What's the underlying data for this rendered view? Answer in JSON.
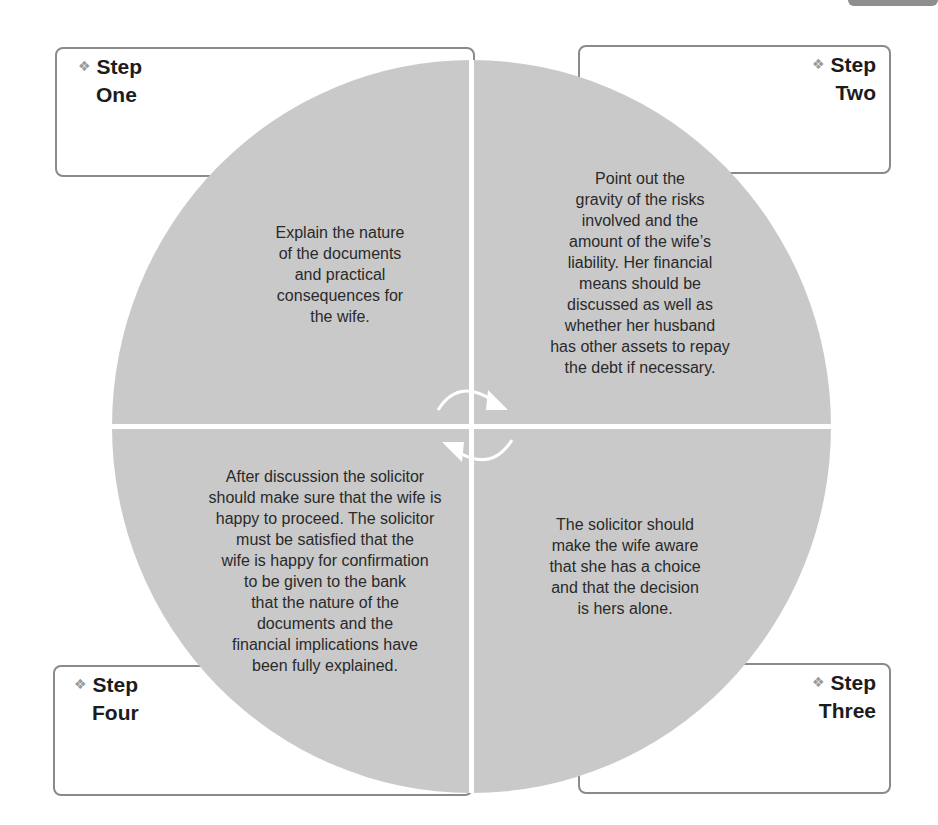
{
  "diagram": {
    "type": "cycle",
    "colors": {
      "circle_fill": "#c9c9c9",
      "box_border": "#8a8a8a",
      "divider": "#ffffff",
      "diamond": "#9a9a9a",
      "corner_tab": "#8e8e8e"
    },
    "bullet_icon": "diamond-cluster-icon",
    "center_icon": "circular-arrows-icon",
    "steps": [
      {
        "label_line1": "Step",
        "label_line2": "One",
        "position": "top-left",
        "text": "Explain the nature of the documents and practical consequences for the wife."
      },
      {
        "label_line1": "Step",
        "label_line2": "Two",
        "position": "top-right",
        "text": "Point out the gravity of the risks involved and the amount of the wife's liability. Her financial means should be discussed as well as whether her husband has other assets to repay the debt if necessary."
      },
      {
        "label_line1": "Step",
        "label_line2": "Three",
        "position": "bottom-right",
        "text": "The solicitor should make the wife aware that she has a choice and that the decision is hers alone."
      },
      {
        "label_line1": "Step",
        "label_line2": "Four",
        "position": "bottom-left",
        "text": "After discussion the solicitor should make sure that the wife is happy to proceed. The solicitor must be satisfied that the wife is happy for confirmation to be given to the bank that the nature of the documents and the financial implications have been fully explained."
      }
    ],
    "text_lines": {
      "one": [
        "Explain the nature",
        "of the documents",
        "and practical",
        "consequences for",
        "the wife."
      ],
      "two": [
        "Point out the",
        "gravity of the risks",
        "involved and the",
        "amount of the wife’s",
        "liability. Her financial",
        "means should be",
        "discussed as well as",
        "whether her husband",
        "has other assets to repay",
        "the debt if necessary."
      ],
      "three": [
        "The solicitor should",
        "make the wife aware",
        "that she has a choice",
        "and that the decision",
        "is hers alone."
      ],
      "four": [
        "After discussion the solicitor",
        "should make sure that the wife is",
        "happy to proceed. The solicitor",
        "must be satisfied that the",
        "wife is happy for confirmation",
        "to be given to the bank",
        "that the nature of the",
        "documents and the",
        "financial implications have",
        "been fully explained."
      ]
    },
    "diamond_glyph": "❖"
  }
}
